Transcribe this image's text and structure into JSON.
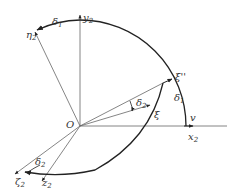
{
  "diagram": {
    "origin_label": "O",
    "axes": [
      {
        "id": "x2",
        "label": "x",
        "sub": "2",
        "extra_label": "v"
      },
      {
        "id": "y2",
        "label": "y",
        "sub": "2"
      },
      {
        "id": "eta2",
        "label": "η",
        "sub": "2"
      },
      {
        "id": "zeta2",
        "label": "ζ",
        "sub": "2"
      },
      {
        "id": "z2",
        "label": "z",
        "sub": "2"
      }
    ],
    "vectors": [
      {
        "id": "xi",
        "label": "ξ"
      },
      {
        "id": "xi_pp",
        "label": "ξ''"
      }
    ],
    "angles": [
      {
        "id": "delta1_top",
        "label": "δ",
        "sub": "1"
      },
      {
        "id": "delta1_right",
        "label": "δ",
        "sub": "1"
      },
      {
        "id": "delta2_mid",
        "label": "δ",
        "sub": "2"
      },
      {
        "id": "delta2_bottom",
        "label": "δ",
        "sub": "2"
      }
    ],
    "colors": {
      "line": "#555555",
      "arc": "#222222",
      "text": "#333333"
    }
  }
}
